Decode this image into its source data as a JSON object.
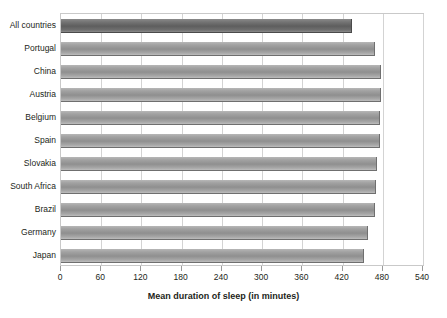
{
  "chart_data": {
    "type": "bar",
    "orientation": "horizontal",
    "title": "",
    "xlabel": "Mean duration of sleep (in minutes)",
    "ylabel": "",
    "categories": [
      "All countries",
      "Portugal",
      "China",
      "Austria",
      "Belgium",
      "Spain",
      "Slovakia",
      "South Africa",
      "Brazil",
      "Germany",
      "Japan"
    ],
    "values": [
      434,
      468,
      478,
      477,
      476,
      476,
      472,
      470,
      468,
      458,
      452
    ],
    "xlim": [
      0,
      540
    ],
    "ylim": null,
    "xticks": [
      0,
      60,
      120,
      180,
      240,
      300,
      360,
      420,
      480,
      540
    ],
    "xtick_labels": [
      "0",
      "60",
      "120",
      "180",
      "240",
      "300",
      "360",
      "420",
      "480",
      "540"
    ],
    "grid": true,
    "grid_axis": "x",
    "legend": null,
    "bar_colors": {
      "default": "#9a9a9a",
      "highlight": "#666666"
    },
    "highlight_index": 0,
    "annotations": []
  }
}
